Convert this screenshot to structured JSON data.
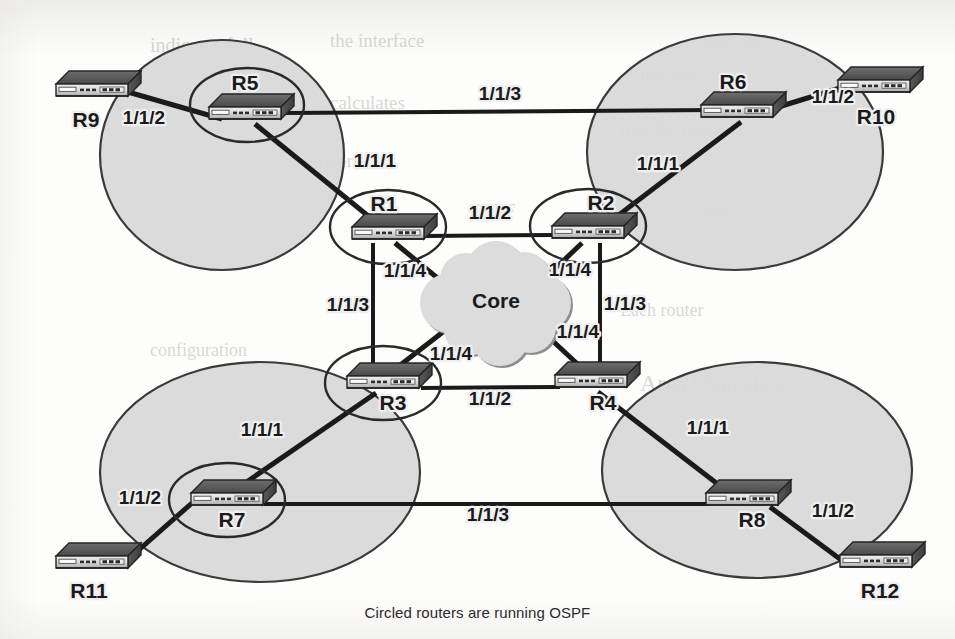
{
  "figure": {
    "caption": "Circled routers are running OSPF",
    "core_cloud_label": "Core",
    "background_color": "#fdfdfc",
    "area_fill_color": "#d9d9d9",
    "line_color": "#1a1a1a"
  },
  "areas": [
    {
      "id": "area-top-left",
      "cx": 222,
      "cy": 155,
      "rx": 122,
      "ry": 115
    },
    {
      "id": "area-top-right",
      "cx": 735,
      "cy": 152,
      "rx": 148,
      "ry": 118
    },
    {
      "id": "area-bottom-left",
      "cx": 260,
      "cy": 472,
      "rx": 160,
      "ry": 110
    },
    {
      "id": "area-bottom-right",
      "cx": 757,
      "cy": 470,
      "rx": 155,
      "ry": 108
    }
  ],
  "ospf_circles": [
    {
      "id": "ospf-circle-r5",
      "cx": 247,
      "cy": 105,
      "rx": 57,
      "ry": 37
    },
    {
      "id": "ospf-circle-r1",
      "cx": 388,
      "cy": 227,
      "rx": 58,
      "ry": 37
    },
    {
      "id": "ospf-circle-r2",
      "cx": 588,
      "cy": 226,
      "rx": 58,
      "ry": 37
    },
    {
      "id": "ospf-circle-r3",
      "cx": 383,
      "cy": 383,
      "rx": 58,
      "ry": 37
    },
    {
      "id": "ospf-circle-r7",
      "cx": 227,
      "cy": 500,
      "rx": 58,
      "ry": 37
    }
  ],
  "routers": [
    {
      "id": "router-r5",
      "name": "R5",
      "x": 245,
      "y": 113,
      "label_x": 245,
      "label_y": 90,
      "circled": true
    },
    {
      "id": "router-r6",
      "name": "R6",
      "x": 737,
      "y": 111,
      "label_x": 733,
      "label_y": 89,
      "circled": false
    },
    {
      "id": "router-r9",
      "name": "R9",
      "x": 92,
      "y": 90,
      "label_x": 86,
      "label_y": 127,
      "circled": false
    },
    {
      "id": "router-r10",
      "name": "R10",
      "x": 874,
      "y": 86,
      "label_x": 876,
      "label_y": 124,
      "circled": false
    },
    {
      "id": "router-r1",
      "name": "R1",
      "x": 388,
      "y": 233,
      "label_x": 384,
      "label_y": 211,
      "circled": true
    },
    {
      "id": "router-r2",
      "name": "R2",
      "x": 588,
      "y": 232,
      "label_x": 601,
      "label_y": 210,
      "circled": true
    },
    {
      "id": "router-r3",
      "name": "R3",
      "x": 383,
      "y": 382,
      "label_x": 393,
      "label_y": 410,
      "circled": true
    },
    {
      "id": "router-r4",
      "name": "R4",
      "x": 591,
      "y": 381,
      "label_x": 603,
      "label_y": 410,
      "circled": false
    },
    {
      "id": "router-r7",
      "name": "R7",
      "x": 227,
      "y": 499,
      "label_x": 232,
      "label_y": 527,
      "circled": true
    },
    {
      "id": "router-r8",
      "name": "R8",
      "x": 742,
      "y": 499,
      "label_x": 752,
      "label_y": 527,
      "circled": false
    },
    {
      "id": "router-r11",
      "name": "R11",
      "x": 92,
      "y": 562,
      "label_x": 89,
      "label_y": 598,
      "circled": false
    },
    {
      "id": "router-r12",
      "name": "R12",
      "x": 876,
      "y": 561,
      "label_x": 880,
      "label_y": 598,
      "circled": false
    }
  ],
  "links": [
    {
      "id": "link-r9-r5",
      "from": "R9",
      "to": "R5",
      "x1": 128,
      "y1": 92,
      "x2": 222,
      "y2": 119,
      "width": 5
    },
    {
      "id": "link-r5-r6",
      "from": "R5",
      "to": "R6",
      "x1": 285,
      "y1": 113,
      "x2": 715,
      "y2": 110,
      "width": 4
    },
    {
      "id": "link-r5-r1",
      "from": "R5",
      "to": "R1",
      "x1": 255,
      "y1": 124,
      "x2": 383,
      "y2": 228,
      "width": 5
    },
    {
      "id": "link-r6-r10",
      "from": "R6",
      "to": "R10",
      "x1": 775,
      "y1": 108,
      "x2": 840,
      "y2": 88,
      "width": 5
    },
    {
      "id": "link-r6-r2",
      "from": "R6",
      "to": "R2",
      "x1": 741,
      "y1": 122,
      "x2": 603,
      "y2": 227,
      "width": 5
    },
    {
      "id": "link-r1-r2",
      "from": "R1",
      "to": "R2",
      "x1": 425,
      "y1": 236,
      "x2": 556,
      "y2": 235,
      "width": 4
    },
    {
      "id": "link-r1-core",
      "from": "R1",
      "to": "Core",
      "x1": 395,
      "y1": 243,
      "x2": 452,
      "y2": 290,
      "width": 5
    },
    {
      "id": "link-r2-core",
      "from": "R2",
      "to": "Core",
      "x1": 582,
      "y1": 243,
      "x2": 540,
      "y2": 283,
      "width": 5
    },
    {
      "id": "link-r3-core",
      "from": "R3",
      "to": "Core",
      "x1": 390,
      "y1": 373,
      "x2": 452,
      "y2": 325,
      "width": 5
    },
    {
      "id": "link-r4-core",
      "from": "R4",
      "to": "Core",
      "x1": 586,
      "y1": 372,
      "x2": 541,
      "y2": 330,
      "width": 5
    },
    {
      "id": "link-r1-r3",
      "from": "R1",
      "to": "R3",
      "x1": 373,
      "y1": 243,
      "x2": 373,
      "y2": 376,
      "width": 4
    },
    {
      "id": "link-r2-r4",
      "from": "R2",
      "to": "R4",
      "x1": 600,
      "y1": 243,
      "x2": 600,
      "y2": 375,
      "width": 4
    },
    {
      "id": "link-r3-r4",
      "from": "R3",
      "to": "R4",
      "x1": 421,
      "y1": 388,
      "x2": 560,
      "y2": 387,
      "width": 4
    },
    {
      "id": "link-r3-r7",
      "from": "R3",
      "to": "R7",
      "x1": 376,
      "y1": 393,
      "x2": 232,
      "y2": 492,
      "width": 5
    },
    {
      "id": "link-r4-r8",
      "from": "R4",
      "to": "R8",
      "x1": 598,
      "y1": 392,
      "x2": 728,
      "y2": 492,
      "width": 5
    },
    {
      "id": "link-r7-r11",
      "from": "R7",
      "to": "R11",
      "x1": 192,
      "y1": 503,
      "x2": 124,
      "y2": 563,
      "width": 5
    },
    {
      "id": "link-r7-r8",
      "from": "R7",
      "to": "R8",
      "x1": 264,
      "y1": 504,
      "x2": 710,
      "y2": 504,
      "width": 4
    },
    {
      "id": "link-r8-r12",
      "from": "R8",
      "to": "R12",
      "x1": 770,
      "y1": 507,
      "x2": 844,
      "y2": 562,
      "width": 5
    }
  ],
  "interface_labels": [
    {
      "id": "iface-r9-r5",
      "text": "1/1/2",
      "x": 144,
      "y": 124,
      "anchor": "middle"
    },
    {
      "id": "iface-r5-r6",
      "text": "1/1/3",
      "x": 500,
      "y": 100,
      "anchor": "middle"
    },
    {
      "id": "iface-r5-r1",
      "text": "1/1/1",
      "x": 375,
      "y": 167,
      "anchor": "middle"
    },
    {
      "id": "iface-r6-r10",
      "text": "1/1/2",
      "x": 833,
      "y": 103,
      "anchor": "middle"
    },
    {
      "id": "iface-r6-r2",
      "text": "1/1/1",
      "x": 658,
      "y": 170,
      "anchor": "middle"
    },
    {
      "id": "iface-r1-r2",
      "text": "1/1/2",
      "x": 490,
      "y": 219,
      "anchor": "middle"
    },
    {
      "id": "iface-r1-core",
      "text": "1/1/4",
      "x": 405,
      "y": 277,
      "anchor": "middle"
    },
    {
      "id": "iface-r2-core",
      "text": "1/1/4",
      "x": 570,
      "y": 276,
      "anchor": "middle"
    },
    {
      "id": "iface-r1-r3",
      "text": "1/1/3",
      "x": 348,
      "y": 311,
      "anchor": "middle"
    },
    {
      "id": "iface-r2-r4",
      "text": "1/1/3",
      "x": 625,
      "y": 310,
      "anchor": "middle"
    },
    {
      "id": "iface-r4-core",
      "text": "1/1/4",
      "x": 578,
      "y": 338,
      "anchor": "middle"
    },
    {
      "id": "iface-r3-core",
      "text": "1/1/4",
      "x": 451,
      "y": 360,
      "anchor": "middle"
    },
    {
      "id": "iface-r3-r4",
      "text": "1/1/2",
      "x": 490,
      "y": 405,
      "anchor": "middle"
    },
    {
      "id": "iface-r3-r7",
      "text": "1/1/1",
      "x": 262,
      "y": 436,
      "anchor": "middle"
    },
    {
      "id": "iface-r4-r8",
      "text": "1/1/1",
      "x": 708,
      "y": 434,
      "anchor": "middle"
    },
    {
      "id": "iface-r7-r11",
      "text": "1/1/2",
      "x": 140,
      "y": 504,
      "anchor": "middle"
    },
    {
      "id": "iface-r7-r8",
      "text": "1/1/3",
      "x": 488,
      "y": 521,
      "anchor": "middle"
    },
    {
      "id": "iface-r8-r12",
      "text": "1/1/2",
      "x": 833,
      "y": 517,
      "anchor": "middle"
    }
  ],
  "core_cloud": {
    "id": "core-cloud",
    "label": "Core",
    "label_x": 496,
    "label_y": 308,
    "cx": 496,
    "cy": 305
  },
  "ghost_text": [
    {
      "text": "indicates full",
      "x": 150,
      "y": 34,
      "size": 20
    },
    {
      "text": "the interface",
      "x": 330,
      "y": 30,
      "size": 19
    },
    {
      "text": "defaults",
      "x": 705,
      "y": 34,
      "size": 19
    },
    {
      "text": "the data",
      "x": 640,
      "y": 64,
      "size": 19
    },
    {
      "text": "calculates",
      "x": 330,
      "y": 92,
      "size": 19
    },
    {
      "text": "link the router",
      "x": 620,
      "y": 118,
      "size": 19
    },
    {
      "text": "network",
      "x": 300,
      "y": 150,
      "size": 19
    },
    {
      "text": "area",
      "x": 700,
      "y": 200,
      "size": 19
    },
    {
      "text": "OSPF",
      "x": 470,
      "y": 200,
      "size": 19
    },
    {
      "text": "Each router",
      "x": 620,
      "y": 300,
      "size": 18
    },
    {
      "text": "configuration",
      "x": 150,
      "y": 340,
      "size": 18
    },
    {
      "text": "Area Overview",
      "x": 640,
      "y": 370,
      "size": 24
    }
  ]
}
